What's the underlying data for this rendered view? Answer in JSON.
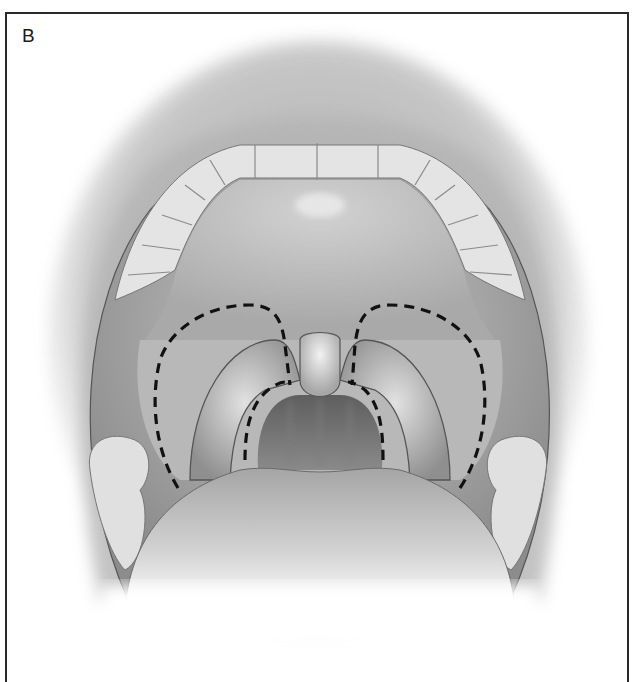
{
  "figure": {
    "panel_label": "B",
    "annotations": {
      "outer_incision": "dashed line outlining soft palate / anterior tonsillar pillars",
      "inner_incision": "dashed line along posterior tonsillar pillars"
    },
    "colors": {
      "frame_border": "#2a2a2a",
      "dash_line": "#111111",
      "tissue_light": "#d6d6d6",
      "tissue_mid": "#a8a8a8",
      "tissue_dark": "#6f6f6f",
      "teeth": "#e6e6e6"
    }
  }
}
